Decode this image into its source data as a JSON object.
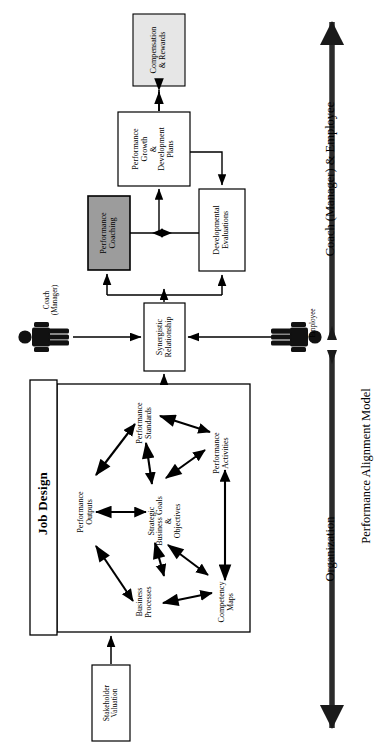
{
  "diagram": {
    "title": "Performance Alignment Model",
    "axis_labels": {
      "top": "Coach (Manager) & Employee",
      "bottom": "Organization",
      "model": "Performance Alignment Model"
    },
    "colors": {
      "stroke": "#000000",
      "fill_white": "#ffffff",
      "fill_light_gray": "#e4e4e4",
      "fill_mid_gray": "#9c9c9c",
      "background": "#ffffff"
    },
    "boxes": {
      "compensation": "Compensation\n& Rewards",
      "compensation_l1": "Compensation",
      "compensation_l2": "& Rewards",
      "growth_l1": "Performance",
      "growth_l2": "Growth",
      "growth_l3": "&",
      "growth_l4": "Development",
      "growth_l5": "Plans",
      "coaching_l1": "Performance",
      "coaching_l2": "Coaching",
      "evaluations_l1": "Developmental",
      "evaluations_l2": "Evaluations",
      "synergistic_l1": "Synergistic",
      "synergistic_l2": "Relationship",
      "stakeholder_l1": "Stakeholder",
      "stakeholder_l2": "Valuation",
      "job_design": "Job Design"
    },
    "actors": {
      "coach_l1": "Coach",
      "coach_l2": "(Manager)",
      "employee": "Employee"
    },
    "job_design_nodes": {
      "performance_standards_l1": "Performance",
      "performance_standards_l2": "Standards",
      "performance_outputs_l1": "Performance",
      "performance_outputs_l2": "Outputs",
      "strategic_goals_l1": "Strategic",
      "strategic_goals_l2": "Business Goals",
      "strategic_goals_l3": "&",
      "strategic_goals_l4": "Objectives",
      "performance_activities_l1": "Performance",
      "performance_activities_l2": "Activities",
      "business_processes_l1": "Business",
      "business_processes_l2": "Processes",
      "competency_maps_l1": "Competency",
      "competency_maps_l2": "Maps"
    }
  }
}
